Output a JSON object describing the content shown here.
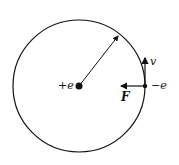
{
  "diagram": {
    "nucleus": {
      "label": "+e"
    },
    "electron": {
      "label": "−e"
    },
    "velocity": {
      "label": "v"
    },
    "force": {
      "label": "F"
    },
    "colors": {
      "ink": "#111111",
      "background": "#ffffff"
    }
  }
}
